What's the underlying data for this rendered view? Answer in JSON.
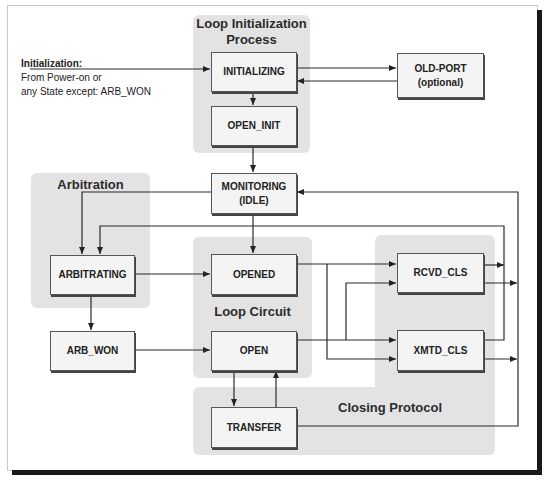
{
  "diagram": {
    "type": "state-machine",
    "regions": [
      {
        "id": "loop_init",
        "title_line1": "Loop Initialization",
        "title_line2": "Process"
      },
      {
        "id": "arbitration",
        "title": "Arbitration"
      },
      {
        "id": "loop_circuit",
        "title": "Loop Circuit"
      },
      {
        "id": "closing_protocol",
        "title": "Closing Protocol"
      }
    ],
    "states": {
      "initializing": "INITIALIZING",
      "open_init": "OPEN_INIT",
      "old_port_line1": "OLD-PORT",
      "old_port_line2": "(optional)",
      "monitoring_line1": "MONITORING",
      "monitoring_line2": "(IDLE)",
      "arbitrating": "ARBITRATING",
      "arb_won": "ARB_WON",
      "opened": "OPENED",
      "open": "OPEN",
      "transfer": "TRANSFER",
      "rcvd_cls": "RCVD_CLS",
      "xmtd_cls": "XMTD_CLS"
    },
    "entry_note": {
      "heading": "Initialization:",
      "line1": "From Power-on or",
      "line2": "any State except: ARB_WON"
    },
    "transitions": [
      {
        "from": "entry",
        "to": "INITIALIZING"
      },
      {
        "from": "INITIALIZING",
        "to": "OLD-PORT"
      },
      {
        "from": "OLD-PORT",
        "to": "INITIALIZING"
      },
      {
        "from": "INITIALIZING",
        "to": "OPEN_INIT"
      },
      {
        "from": "OPEN_INIT",
        "to": "MONITORING"
      },
      {
        "from": "MONITORING",
        "to": "ARBITRATING"
      },
      {
        "from": "MONITORING",
        "to": "OPENED"
      },
      {
        "from": "ARBITRATING",
        "to": "OPENED"
      },
      {
        "from": "ARBITRATING",
        "to": "ARB_WON"
      },
      {
        "from": "ARB_WON",
        "to": "OPEN"
      },
      {
        "from": "OPENED",
        "to": "RCVD_CLS"
      },
      {
        "from": "OPENED",
        "to": "XMTD_CLS"
      },
      {
        "from": "OPEN",
        "to": "RCVD_CLS"
      },
      {
        "from": "OPEN",
        "to": "XMTD_CLS"
      },
      {
        "from": "OPEN",
        "to": "TRANSFER"
      },
      {
        "from": "TRANSFER",
        "to": "OPEN"
      },
      {
        "from": "RCVD_CLS",
        "to": "ARBITRATING"
      },
      {
        "from": "XMTD_CLS",
        "to": "ARBITRATING"
      },
      {
        "from": "RCVD_CLS",
        "to": "MONITORING"
      },
      {
        "from": "XMTD_CLS",
        "to": "MONITORING"
      },
      {
        "from": "TRANSFER",
        "to": "MONITORING"
      }
    ]
  }
}
